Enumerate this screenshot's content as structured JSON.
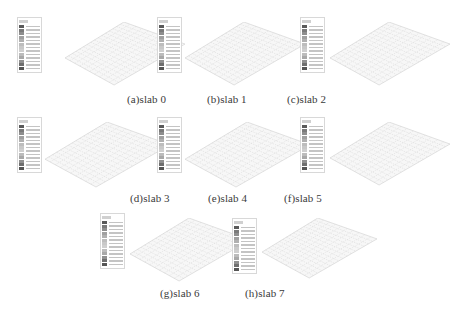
{
  "figure": {
    "panels": [
      {
        "id": "a",
        "caption": "(a)slab 0",
        "legend_title": "Mises"
      },
      {
        "id": "b",
        "caption": "(b)slab 1",
        "legend_title": "Mises"
      },
      {
        "id": "c",
        "caption": "(c)slab 2",
        "legend_title": "Mises"
      },
      {
        "id": "d",
        "caption": "(d)slab 3",
        "legend_title": "Mises"
      },
      {
        "id": "e",
        "caption": "(e)slab 4",
        "legend_title": "Mises"
      },
      {
        "id": "f",
        "caption": "(f)slab 5",
        "legend_title": "Mises"
      },
      {
        "id": "g",
        "caption": "(g)slab 6",
        "legend_title": "Mises"
      },
      {
        "id": "h",
        "caption": "(h)slab 7",
        "legend_title": "Mises"
      }
    ],
    "legend_colors": [
      "#5a5a5a",
      "#7a7a7a",
      "#8e8e8e",
      "#a0a0a0",
      "#b0b0b0",
      "#bdbdbd",
      "#c8c8c8",
      "#cfcfcf",
      "#bcbcbc",
      "#a8a8a8",
      "#909090",
      "#6e6e6e",
      "#555555"
    ]
  }
}
